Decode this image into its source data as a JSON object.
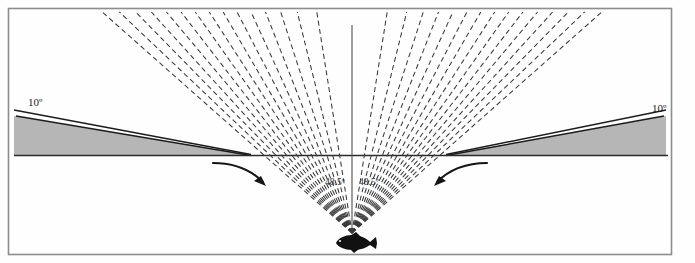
{
  "figure": {
    "background_color": "#fefefe",
    "frame": {
      "color": "#8d8d8d",
      "x": 8,
      "y": 8,
      "width": 664,
      "height": 247
    },
    "labels": {
      "left_angle": "10º",
      "right_angle": "10º",
      "center_left_angle": "48.5º",
      "center_right_angle": "48.5º"
    },
    "colors": {
      "ray": "#3a3a3a",
      "surface_line": "#2b2b2b",
      "wedge_fill": "#b6b6b6",
      "wedge_edge": "#1c1c1c",
      "fish": "#111111",
      "arrow": "#151515",
      "axis": "#5a5a5a"
    },
    "geometry": {
      "apex_x": 352,
      "apex_y": 233,
      "horizon_y": 155,
      "vertical_axis_top_y": 25,
      "left_wedge_tip_x": 250,
      "right_wedge_tip_x": 447,
      "left_wedge_outer_x": 14,
      "right_wedge_outer_x": 666,
      "wedge_outer_top_y": 113,
      "fan_half_angle_deg": 48.5,
      "surface_tilt_deg": 10,
      "ray_count_per_side": 15
    },
    "elements": {
      "fish_name": "fish-silhouette",
      "left_arrow_name": "left-curved-arrow",
      "right_arrow_name": "right-curved-arrow",
      "vertical_axis_name": "vertical-normal-axis",
      "horizon_name": "water-surface-line"
    }
  },
  "chart_data": {
    "type": "diagram",
    "annotations": [
      {
        "text": "10º",
        "position": "upper-left",
        "x": 34,
        "y": 102
      },
      {
        "text": "10º",
        "position": "upper-right",
        "x": 660,
        "y": 108
      },
      {
        "text": "48.5º",
        "position": "center-left-of-axis",
        "x": 336,
        "y": 182
      },
      {
        "text": "48.5º",
        "position": "center-right-of-axis",
        "x": 368,
        "y": 182
      }
    ],
    "rays": {
      "count_left": 15,
      "count_right": 15,
      "style": "dashed",
      "origin": [
        352,
        233
      ],
      "half_angle_deg": 48.5
    },
    "surfaces": [
      {
        "name": "left-grazing-surface",
        "angle_deg": 10,
        "from": [
          14,
          113
        ],
        "to": [
          250,
          155
        ]
      },
      {
        "name": "right-grazing-surface",
        "angle_deg": 10,
        "from": [
          666,
          113
        ],
        "to": [
          447,
          155
        ]
      },
      {
        "name": "water-surface",
        "angle_deg": 0,
        "from": [
          14,
          155
        ],
        "to": [
          666,
          155
        ]
      }
    ]
  }
}
